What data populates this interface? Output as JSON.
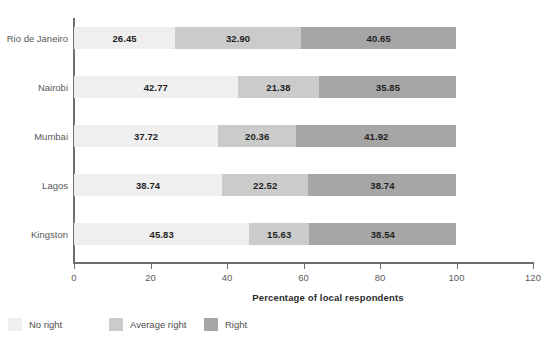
{
  "chart_data": {
    "type": "bar",
    "orientation": "horizontal",
    "stacked": true,
    "title": "",
    "subtitle": "",
    "xlabel": "Percentage of local respondents",
    "ylabel": "",
    "xlim": [
      0,
      120
    ],
    "xticks": [
      0,
      20,
      40,
      60,
      80,
      100,
      120
    ],
    "xtick_labels": [
      "0",
      "20",
      "40",
      "60",
      "80",
      "100",
      "120"
    ],
    "grid": false,
    "legend_position": "bottom-left",
    "categories": [
      "Rio de Janeiro",
      "Nairobi",
      "Mumbai",
      "Lagos",
      "Kingston"
    ],
    "series": [
      {
        "name": "No right",
        "color": "#efefef",
        "values": [
          26.45,
          42.77,
          37.72,
          38.74,
          45.83
        ],
        "labels": [
          "26.45",
          "42.77",
          "37.72",
          "38.74",
          "45.83"
        ]
      },
      {
        "name": "Average right",
        "color": "#cbcbcb",
        "values": [
          32.9,
          21.38,
          20.36,
          22.52,
          15.63
        ],
        "labels": [
          "32.90",
          "21.38",
          "20.36",
          "22.52",
          "15.63"
        ]
      },
      {
        "name": "Right",
        "color": "#a6a6a6",
        "values": [
          40.65,
          35.85,
          41.92,
          38.74,
          38.54
        ],
        "labels": [
          "40.65",
          "35.85",
          "41.92",
          "38.74",
          "38.54"
        ]
      }
    ]
  },
  "legend": {
    "items": [
      {
        "label": "No right",
        "color": "#efefef"
      },
      {
        "label": "Average right",
        "color": "#cbcbcb"
      },
      {
        "label": "Right",
        "color": "#a6a6a6"
      }
    ]
  },
  "axis": {
    "x_title": "Percentage of local respondents"
  },
  "colors": {
    "axis_line": "#6e6e6e",
    "tick_text": "#5a5a5a",
    "value_text": "#1f1f1f",
    "background": "#ffffff"
  }
}
